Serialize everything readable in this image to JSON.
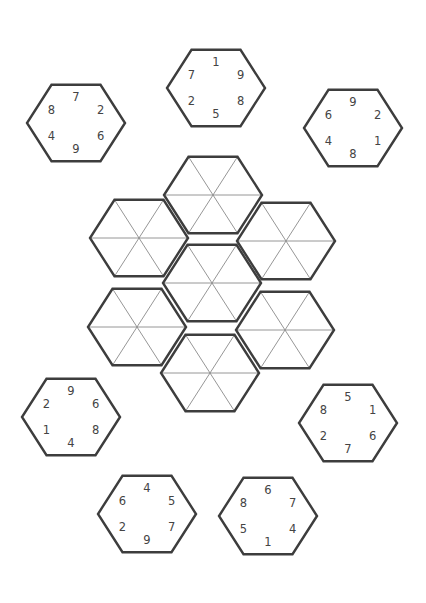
{
  "puzzle": {
    "type": "hexagon-tile-puzzle",
    "colors": {
      "outline": "#3d3d3d",
      "spoke": "#8a8a8a",
      "number": "#444444",
      "background": "#ffffff"
    },
    "hex_radius": 49,
    "hex_vscale": 0.9,
    "number_order": [
      "top",
      "upper-right",
      "lower-right",
      "bottom",
      "lower-left",
      "upper-left"
    ],
    "pieces": [
      {
        "id": "piece-top-left",
        "cx": 76,
        "cy": 123,
        "numbers": [
          "7",
          "2",
          "6",
          "9",
          "4",
          "8"
        ]
      },
      {
        "id": "piece-top-middle",
        "cx": 216,
        "cy": 88,
        "numbers": [
          "1",
          "9",
          "8",
          "5",
          "2",
          "7"
        ]
      },
      {
        "id": "piece-top-right",
        "cx": 353,
        "cy": 128,
        "numbers": [
          "9",
          "2",
          "1",
          "8",
          "4",
          "6"
        ]
      },
      {
        "id": "piece-middle-left",
        "cx": 71,
        "cy": 417,
        "numbers": [
          "9",
          "6",
          "8",
          "4",
          "1",
          "2"
        ]
      },
      {
        "id": "piece-middle-right",
        "cx": 348,
        "cy": 423,
        "numbers": [
          "5",
          "1",
          "6",
          "7",
          "2",
          "8"
        ]
      },
      {
        "id": "piece-bottom-left",
        "cx": 147,
        "cy": 514,
        "numbers": [
          "4",
          "5",
          "7",
          "9",
          "2",
          "6"
        ]
      },
      {
        "id": "piece-bottom-right",
        "cx": 268,
        "cy": 516,
        "numbers": [
          "6",
          "7",
          "4",
          "1",
          "5",
          "8"
        ]
      }
    ],
    "board_slots": [
      {
        "id": "slot-top",
        "cx": 213,
        "cy": 195
      },
      {
        "id": "slot-upper-left",
        "cx": 139,
        "cy": 238
      },
      {
        "id": "slot-upper-right",
        "cx": 286,
        "cy": 241
      },
      {
        "id": "slot-center",
        "cx": 212,
        "cy": 283
      },
      {
        "id": "slot-lower-left",
        "cx": 137,
        "cy": 327
      },
      {
        "id": "slot-lower-right",
        "cx": 285,
        "cy": 330
      },
      {
        "id": "slot-bottom",
        "cx": 210,
        "cy": 373
      }
    ]
  }
}
